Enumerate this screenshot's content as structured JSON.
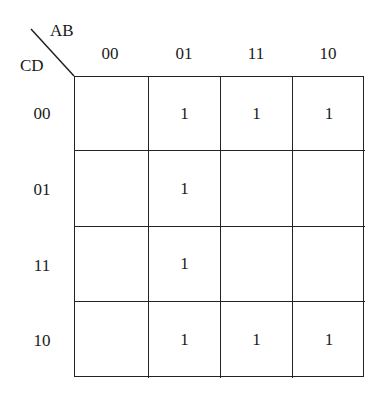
{
  "kmap": {
    "row_variable": "CD",
    "col_variable": "AB",
    "col_labels": [
      "00",
      "01",
      "11",
      "10"
    ],
    "row_labels": [
      "00",
      "01",
      "11",
      "10"
    ],
    "cells": [
      [
        "",
        "1",
        "1",
        "1"
      ],
      [
        "",
        "1",
        "",
        ""
      ],
      [
        "",
        "1",
        "",
        ""
      ],
      [
        "",
        "1",
        "1",
        "1"
      ]
    ]
  }
}
